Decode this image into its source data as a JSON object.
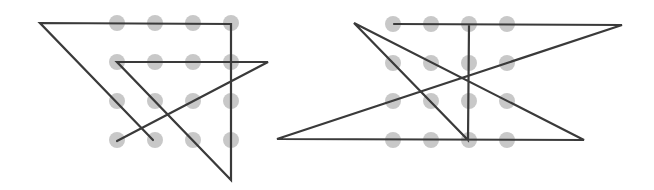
{
  "diagram": {
    "type": "nine-dot-style puzzle solutions (4x4 dot grid connected by continuous line)",
    "colors": {
      "background": "#ffffff",
      "dot": "#c8c8c8",
      "line": "#3a3a3a"
    },
    "dot_radius": 8,
    "line_width": 2.2,
    "puzzles": [
      {
        "id": "left",
        "grid": {
          "xs": [
            117,
            155,
            193,
            231
          ],
          "ys": [
            23,
            62,
            101,
            140
          ]
        },
        "path": [
          [
            153,
            140
          ],
          [
            40,
            23
          ],
          [
            231,
            24
          ],
          [
            231,
            180
          ],
          [
            117,
            62
          ],
          [
            268,
            62
          ],
          [
            117,
            141
          ]
        ]
      },
      {
        "id": "right",
        "grid": {
          "xs": [
            393,
            431,
            469,
            507
          ],
          "ys": [
            24,
            63,
            101,
            140
          ]
        },
        "path": [
          [
            394,
            24
          ],
          [
            622,
            25
          ],
          [
            277,
            139
          ],
          [
            584,
            140
          ],
          [
            354,
            23
          ],
          [
            468,
            140
          ],
          [
            469,
            25
          ]
        ]
      }
    ]
  }
}
